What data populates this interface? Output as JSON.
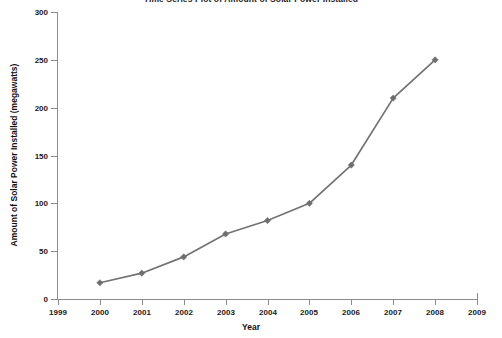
{
  "chart_data": {
    "type": "line",
    "title": "Time Series Plot of Amount of Solar Power Installed",
    "xlabel": "Year",
    "ylabel": "Amount of Solar Power Installed (megawatts)",
    "x": [
      2000,
      2001,
      2002,
      2003,
      2004,
      2005,
      2006,
      2007,
      2008
    ],
    "values": [
      17,
      27,
      44,
      68,
      82,
      100,
      140,
      210,
      250
    ],
    "series": [
      {
        "name": "Amount of Solar Power Installed (megawatts)",
        "x": [
          2000,
          2001,
          2002,
          2003,
          2004,
          2005,
          2006,
          2007,
          2008
        ],
        "values": [
          17,
          27,
          44,
          68,
          82,
          100,
          140,
          210,
          250
        ]
      }
    ],
    "xlim": [
      1999,
      2009
    ],
    "ylim": [
      0,
      300
    ],
    "xticks": [
      "1999",
      "2000",
      "2001",
      "2002",
      "2003",
      "2004",
      "2005",
      "2006",
      "2007",
      "2008",
      "2009"
    ],
    "xtick_values": [
      1999,
      2000,
      2001,
      2002,
      2003,
      2004,
      2005,
      2006,
      2007,
      2008,
      2009
    ],
    "yticks": [
      "0",
      "50",
      "100",
      "150",
      "200",
      "250",
      "300"
    ],
    "ytick_values": [
      0,
      50,
      100,
      150,
      200,
      250,
      300
    ],
    "grid": false,
    "legend": "none",
    "marker": "diamond",
    "line_color": "#737373",
    "marker_color": "#6e6e6e",
    "axis_color": "#8c8c8c",
    "text_color": "#1a1a1a",
    "background": "#ffffff"
  }
}
